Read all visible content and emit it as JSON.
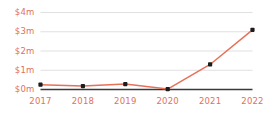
{
  "chart_data": {
    "type": "line",
    "title": "",
    "subtitle": "",
    "xlabel": "",
    "ylabel": "",
    "categories": [
      "2017",
      "2018",
      "2019",
      "2020",
      "2021",
      "2022"
    ],
    "values": [
      0.25,
      0.18,
      0.28,
      0.02,
      1.3,
      3.1
    ],
    "series": [
      {
        "name": "",
        "values": [
          0.25,
          0.18,
          0.28,
          0.02,
          1.3,
          3.1
        ]
      }
    ],
    "ylim": [
      0,
      4
    ],
    "xlim": [
      "2017",
      "2022"
    ],
    "ytick_labels": [
      "$0m",
      "$1m",
      "$2m",
      "$3m",
      "$4m"
    ],
    "ytick_values": [
      0,
      1,
      2,
      3,
      4
    ],
    "xtick_labels": [
      "2017",
      "2018",
      "2019",
      "2020",
      "2021",
      "2022"
    ],
    "grid": true,
    "grid_axis": "y",
    "legend": false,
    "legend_position": "none",
    "markers": true,
    "annotations": []
  },
  "colors": {
    "line": "#e8705a",
    "marker": "#1c1c1c",
    "tick_text": "#e2705c",
    "gridline": "#d8d8d8",
    "baseline": "#3a3a3a",
    "background": "#ffffff"
  }
}
